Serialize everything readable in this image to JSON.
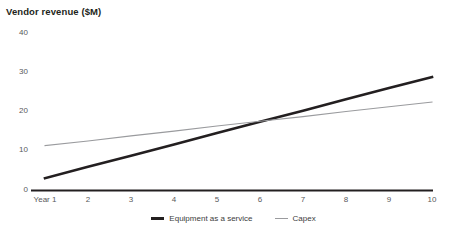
{
  "chart_data": {
    "type": "line",
    "title": "Vendor revenue ($M)",
    "xlabel": "",
    "ylabel": "",
    "x": [
      1,
      2,
      3,
      4,
      5,
      6,
      7,
      8,
      9,
      10
    ],
    "categories": [
      "Year 1",
      "2",
      "3",
      "4",
      "5",
      "6",
      "7",
      "8",
      "9",
      "10"
    ],
    "series": [
      {
        "name": "Equipment as a service",
        "color": "#231f20",
        "values": [
          3.0,
          5.9,
          8.7,
          11.6,
          14.5,
          17.4,
          20.2,
          23.1,
          26.0,
          28.8
        ]
      },
      {
        "name": "Capex",
        "color": "#9a9b9e",
        "values": [
          11.3,
          12.5,
          13.8,
          15.0,
          16.3,
          17.5,
          18.7,
          20.0,
          21.2,
          22.4
        ]
      }
    ],
    "ylim": [
      0,
      40
    ],
    "yticks": [
      0,
      10,
      20,
      30,
      40
    ],
    "ytick_labels": [
      "0",
      "10",
      "20",
      "30",
      "40"
    ],
    "xlim": [
      1,
      10
    ],
    "grid": false,
    "legend_position": "bottom"
  },
  "legend": {
    "items": [
      {
        "label": "Equipment as a service",
        "swatch": "thick-dark-line-icon"
      },
      {
        "label": "Capex",
        "swatch": "thin-gray-line-icon"
      }
    ]
  },
  "axis": {
    "x_axis_icon": "horizontal-axis-line",
    "y_tick_labels": [
      "40",
      "30",
      "20",
      "10",
      "0"
    ],
    "x_tick_labels": [
      "Year 1",
      "2",
      "3",
      "4",
      "5",
      "6",
      "7",
      "8",
      "9",
      "10"
    ]
  },
  "colors": {
    "background": "#ffffff",
    "text": "#231f20",
    "tick_text": "#58595b",
    "series_primary": "#231f20",
    "series_secondary": "#9a9b9e",
    "axis": "#231f20"
  }
}
